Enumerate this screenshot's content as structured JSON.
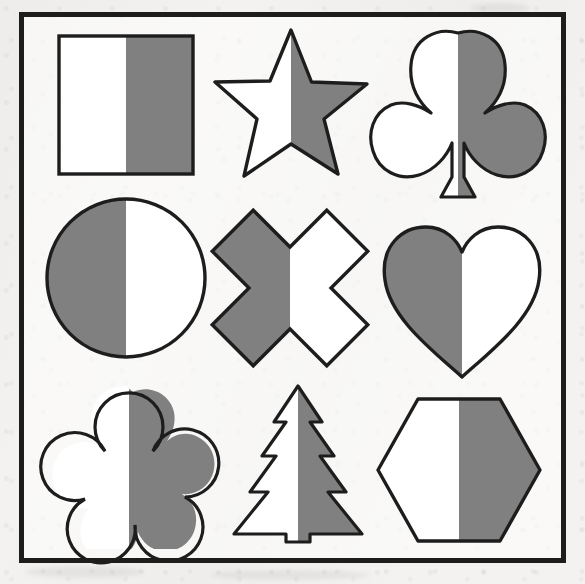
{
  "worksheet": {
    "title": "Half-shaded shapes worksheet",
    "background_color": "#f3f2f0",
    "frame_color": "#1d1d1d",
    "fill_gray": "#808080",
    "fill_white": "#ffffff",
    "outline_color": "#1d1d1d",
    "grid_rows": 3,
    "grid_columns": 3
  },
  "shapes": [
    {
      "id": "square",
      "name": "Square",
      "row": 1,
      "column": 1,
      "shaded_half": "right",
      "left_fill": "#ffffff",
      "right_fill": "#808080",
      "fraction_shaded": "1/2"
    },
    {
      "id": "star",
      "name": "Star",
      "row": 1,
      "column": 2,
      "shaded_half": "right",
      "left_fill": "#ffffff",
      "right_fill": "#808080",
      "fraction_shaded": "1/2"
    },
    {
      "id": "clover",
      "name": "Clover",
      "row": 1,
      "column": 3,
      "shaded_half": "right",
      "left_fill": "#ffffff",
      "right_fill": "#808080",
      "fraction_shaded": "1/2"
    },
    {
      "id": "circle",
      "name": "Circle",
      "row": 2,
      "column": 1,
      "shaded_half": "left",
      "left_fill": "#808080",
      "right_fill": "#ffffff",
      "fraction_shaded": "1/2"
    },
    {
      "id": "cross",
      "name": "Cross",
      "row": 2,
      "column": 2,
      "shaded_half": "left",
      "left_fill": "#808080",
      "right_fill": "#ffffff",
      "fraction_shaded": "1/2"
    },
    {
      "id": "heart",
      "name": "Heart",
      "row": 2,
      "column": 3,
      "shaded_half": "left",
      "left_fill": "#808080",
      "right_fill": "#ffffff",
      "fraction_shaded": "1/2"
    },
    {
      "id": "flower",
      "name": "Flower",
      "row": 3,
      "column": 1,
      "shaded_half": "right",
      "left_fill": "#ffffff",
      "right_fill": "#808080",
      "fraction_shaded": "1/2"
    },
    {
      "id": "tree",
      "name": "Tree",
      "row": 3,
      "column": 2,
      "shaded_half": "right",
      "left_fill": "#ffffff",
      "right_fill": "#808080",
      "fraction_shaded": "1/2"
    },
    {
      "id": "hexagon",
      "name": "Hexagon",
      "row": 3,
      "column": 3,
      "shaded_half": "right",
      "left_fill": "#ffffff",
      "right_fill": "#808080",
      "fraction_shaded": "1/2"
    }
  ]
}
